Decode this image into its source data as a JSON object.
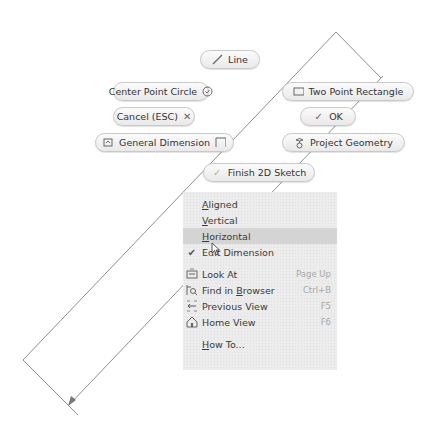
{
  "marking_menu": {
    "line": {
      "label": "Line",
      "icon": "line-icon"
    },
    "center_point_circle": {
      "label": "Center Point Circle",
      "icon": "circle-icon"
    },
    "two_point_rectangle": {
      "label": "Two Point Rectangle",
      "icon": "rectangle-icon"
    },
    "cancel": {
      "label": "Cancel (ESC)",
      "icon": "close-icon"
    },
    "ok": {
      "label": "OK",
      "icon": "checkmark-icon"
    },
    "general_dimension": {
      "label": "General Dimension",
      "icon": "dimension-icon"
    },
    "project_geometry": {
      "label": "Project Geometry",
      "icon": "project-geometry-icon"
    },
    "finish_sketch": {
      "label": "Finish 2D Sketch",
      "icon": "finish-sketch-icon"
    }
  },
  "context_menu": {
    "items": [
      {
        "label": "Aligned",
        "mnemonic": "A",
        "rest": "ligned",
        "shortcut": "",
        "highlighted": false
      },
      {
        "label": "Vertical",
        "mnemonic": "V",
        "rest": "ertical",
        "shortcut": "",
        "highlighted": false
      },
      {
        "label": "Horizontal",
        "mnemonic": "H",
        "rest": "orizontal",
        "shortcut": "",
        "highlighted": true
      },
      {
        "label": "Edit Dimension",
        "checked": true,
        "shortcut": "",
        "highlighted": false
      },
      {
        "label": "Look At",
        "shortcut": "Page Up",
        "icon": "look-at-icon"
      },
      {
        "label": "Find in Browser",
        "pre": "Find in ",
        "mnemonic": "B",
        "rest": "rowser",
        "shortcut": "Ctrl+B",
        "icon": "find-in-browser-icon"
      },
      {
        "label": "Previous View",
        "shortcut": "F5",
        "icon": "previous-view-icon"
      },
      {
        "label": "Home View",
        "shortcut": "F6",
        "icon": "home-view-icon"
      },
      {
        "label": "How To...",
        "mnemonic": "H",
        "rest": "ow To...",
        "shortcut": ""
      }
    ]
  },
  "colors": {
    "sketch_line": "#8a8a8a",
    "menu_bg": "#ececec",
    "menu_highlight": "#d4d4d4",
    "bubble_border": "#c9c9c9"
  }
}
